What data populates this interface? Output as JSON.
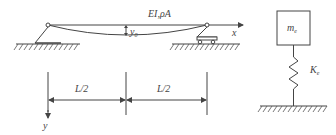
{
  "beam": {
    "properties_label": "EI,ρA",
    "deflection_label": "y",
    "deflection_subscript": "0",
    "x_axis_label": "x",
    "y_axis_label": "y",
    "left_support": "pin-support",
    "right_support": "roller-support"
  },
  "dimensions": {
    "left_span_label": "L/2",
    "right_span_label": "L/2"
  },
  "equivalent_system": {
    "mass_label": "m",
    "mass_subscript": "e",
    "spring_label": "K",
    "spring_subscript": "e"
  },
  "colors": {
    "line": "#444444",
    "hatch": "#555555"
  }
}
